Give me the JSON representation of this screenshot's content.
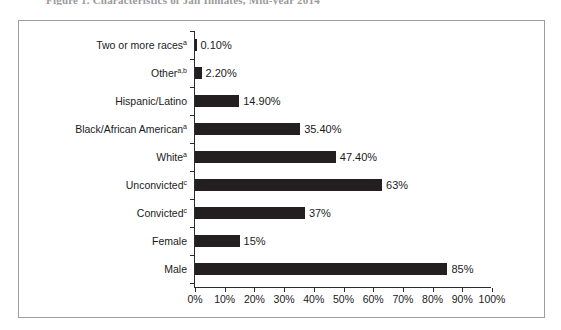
{
  "figure": {
    "title_clipped": "Figure 1. Characteristics of Jail Inmates, Mid-year 2014",
    "frame_border_color": "#9d9d9d"
  },
  "chart_data": {
    "type": "bar",
    "orientation": "horizontal",
    "title": "",
    "xlabel": "",
    "ylabel": "",
    "xlim": [
      0,
      100
    ],
    "grid": false,
    "legend": null,
    "bar_color": "#231f20",
    "axis_color": "#2b2b2b",
    "categories": [
      "Two or more races",
      "Other",
      "Hispanic/Latino",
      "Black/African American",
      "White",
      "Unconvicted",
      "Convicted",
      "Female",
      "Male"
    ],
    "category_superscripts": [
      "a",
      "a,b",
      "",
      "a",
      "a",
      "c",
      "c",
      "",
      ""
    ],
    "values": [
      0.1,
      2.2,
      14.9,
      35.4,
      47.4,
      63,
      37,
      15,
      85
    ],
    "value_labels": [
      "0.10%",
      "2.20%",
      "14.90%",
      "35.40%",
      "47.40%",
      "63%",
      "37%",
      "15%",
      "85%"
    ],
    "xticks": [
      0,
      10,
      20,
      30,
      40,
      50,
      60,
      70,
      80,
      90,
      100
    ],
    "xticklabels": [
      "0%",
      "10%",
      "20%",
      "30%",
      "40%",
      "50%",
      "60%",
      "70%",
      "80%",
      "90%",
      "100%"
    ]
  }
}
